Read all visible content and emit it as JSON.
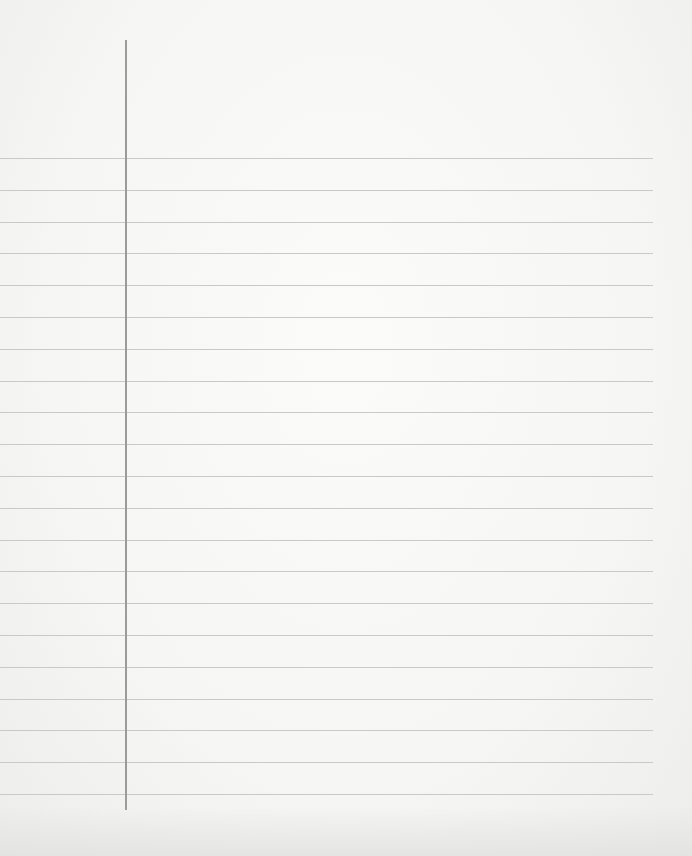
{
  "page": {
    "type": "blank lined notebook paper",
    "background_color": "#f7f7f6",
    "rule_color": "#c9c9c9",
    "margin_line_color": "#9b9b9b",
    "rules": {
      "count": 21,
      "first_y": 158,
      "spacing": 31.8,
      "x_start": 0,
      "x_end": 653
    },
    "margin_line": {
      "x": 125,
      "y_start": 40,
      "y_end": 810
    },
    "text_content": []
  }
}
